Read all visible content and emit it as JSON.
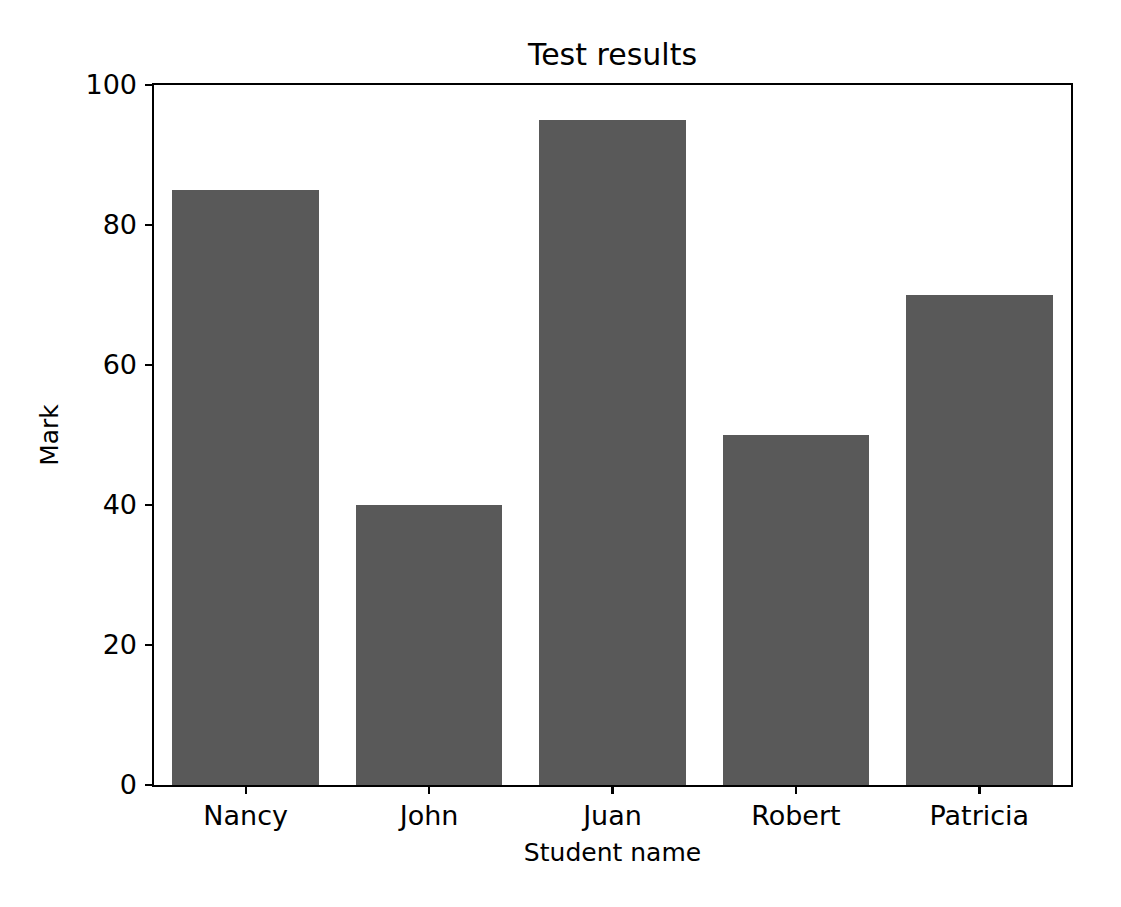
{
  "chart_data": {
    "type": "bar",
    "title": "Test results",
    "xlabel": "Student name",
    "ylabel": "Mark",
    "categories": [
      "Nancy",
      "John",
      "Juan",
      "Robert",
      "Patricia"
    ],
    "values": [
      85,
      40,
      95,
      50,
      70
    ],
    "ylim": [
      0,
      100
    ],
    "yticks": [
      0,
      20,
      40,
      60,
      80,
      100
    ],
    "ytick_labels": [
      "0",
      "20",
      "40",
      "60",
      "80",
      "100"
    ],
    "grid": false,
    "legend": null,
    "bar_color": "#595959",
    "axes_color": "#000000",
    "background_color": "#ffffff",
    "bar_width_ratio": 0.8
  }
}
